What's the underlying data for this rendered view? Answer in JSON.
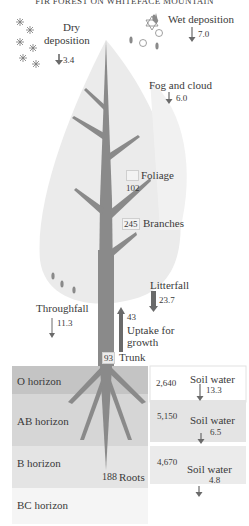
{
  "title": "FIR FOREST ON WHITEFACE MOUNTAIN",
  "inputs": {
    "dry_deposition": {
      "label_line1": "Dry",
      "label_line2": "deposition",
      "value": "3.4"
    },
    "wet_deposition": {
      "label": "Wet deposition",
      "value": "7.0"
    },
    "fog_and_cloud": {
      "label": "Fog and cloud",
      "value": "6.0"
    }
  },
  "pools": {
    "foliage": {
      "label": "Foliage",
      "value": "102"
    },
    "branches": {
      "label": "Branches",
      "value": "245"
    },
    "trunk": {
      "label": "Trunk",
      "value": "93"
    },
    "roots": {
      "label": "Roots",
      "value": "188"
    }
  },
  "fluxes": {
    "throughfall": {
      "label": "Throughfall",
      "value": "11.3"
    },
    "litterfall": {
      "label": "Litterfall",
      "value": "23.7"
    },
    "uptake": {
      "label_line1": "Uptake for",
      "label_line2": "growth",
      "value": "43"
    }
  },
  "soil": {
    "horizons": [
      {
        "label": "O horizon",
        "pool": "2,640",
        "water_label": "Soil water",
        "water_value": "13.3"
      },
      {
        "label": "AB horizon",
        "pool": "5,150",
        "water_label": "Soil water",
        "water_value": "6.5"
      },
      {
        "label": "B horizon",
        "pool": "4,670",
        "water_label": "Soil water",
        "water_value": "4.8"
      },
      {
        "label": "BC horizon"
      }
    ]
  },
  "colors": {
    "canopy": "#e9e9e9",
    "trunk": "#8a8a8a",
    "o_horizon": "#c4c4c4",
    "ab_horizon": "#d6d6d6",
    "b_horizon": "#e4e4e4",
    "bc_horizon": "#f5f5f5",
    "arrow": "#6a6a6a"
  }
}
